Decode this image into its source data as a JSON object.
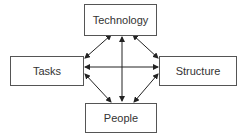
{
  "diagram": {
    "nodes": {
      "technology": {
        "label": "Technology"
      },
      "tasks": {
        "label": "Tasks"
      },
      "structure": {
        "label": "Structure"
      },
      "people": {
        "label": "People"
      }
    },
    "edges": [
      {
        "from": "Technology",
        "to": "Tasks",
        "type": "bidirectional"
      },
      {
        "from": "Technology",
        "to": "Structure",
        "type": "bidirectional"
      },
      {
        "from": "Technology",
        "to": "People",
        "type": "bidirectional"
      },
      {
        "from": "Tasks",
        "to": "Structure",
        "type": "bidirectional"
      },
      {
        "from": "Tasks",
        "to": "People",
        "type": "bidirectional"
      },
      {
        "from": "Structure",
        "to": "People",
        "type": "bidirectional"
      }
    ],
    "colors": {
      "line": "#222222",
      "border": "#555555",
      "text": "#333333"
    }
  }
}
